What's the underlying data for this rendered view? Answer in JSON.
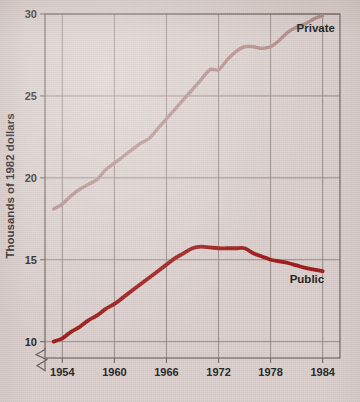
{
  "figure": {
    "background_color": "#d8cdca",
    "plot_area": {
      "left": 45,
      "top": 14,
      "right": 340,
      "bottom": 358
    }
  },
  "chart_data": {
    "type": "line",
    "title": "",
    "subtitle": "",
    "xlabel": "",
    "ylabel": "Thousands of 1982 dollars",
    "xlim": [
      1952,
      1986
    ],
    "ylim": [
      9,
      30
    ],
    "ytick_labels": [
      "10",
      "15",
      "20",
      "25",
      "30"
    ],
    "ytick_values": [
      10,
      15,
      20,
      25,
      30
    ],
    "xtick_labels": [
      "1954",
      "1960",
      "1966",
      "1972",
      "1978",
      "1984"
    ],
    "xtick_values": [
      1954,
      1960,
      1966,
      1972,
      1978,
      1984
    ],
    "grid": true,
    "legend_position": "inline-annotations",
    "y_axis_break": true,
    "y_axis_break_note": "zigzag break below 10 indicating truncated axis",
    "annotations": [
      {
        "text": "Private",
        "x": 1981.0,
        "y": 28.9
      },
      {
        "text": "Public",
        "x": 1980.2,
        "y": 13.6
      }
    ],
    "series": [
      {
        "name": "Private",
        "color": "#b08a87",
        "linewidth": 3.4,
        "x": [
          1953,
          1954,
          1955,
          1956,
          1957,
          1958,
          1959,
          1960,
          1961,
          1962,
          1963,
          1964,
          1965,
          1966,
          1967,
          1968,
          1969,
          1970,
          1971,
          1972,
          1973,
          1974,
          1975,
          1976,
          1977,
          1978,
          1979,
          1980,
          1981,
          1982,
          1983,
          1984
        ],
        "values": [
          18.1,
          18.4,
          18.9,
          19.3,
          19.6,
          19.9,
          20.5,
          20.9,
          21.3,
          21.7,
          22.1,
          22.4,
          23.0,
          23.6,
          24.2,
          24.8,
          25.4,
          26.0,
          26.6,
          26.6,
          27.2,
          27.7,
          28.0,
          28.0,
          27.9,
          28.0,
          28.4,
          28.9,
          29.2,
          29.4,
          29.7,
          29.9
        ]
      },
      {
        "name": "Public",
        "color": "#9b1515",
        "linewidth": 3.8,
        "x": [
          1953,
          1954,
          1955,
          1956,
          1957,
          1958,
          1959,
          1960,
          1961,
          1962,
          1963,
          1964,
          1965,
          1966,
          1967,
          1968,
          1969,
          1970,
          1971,
          1972,
          1973,
          1974,
          1975,
          1976,
          1977,
          1978,
          1979,
          1980,
          1981,
          1982,
          1983,
          1984
        ],
        "values": [
          10.0,
          10.2,
          10.6,
          10.9,
          11.3,
          11.6,
          12.0,
          12.3,
          12.7,
          13.1,
          13.5,
          13.9,
          14.3,
          14.7,
          15.1,
          15.4,
          15.7,
          15.8,
          15.75,
          15.7,
          15.7,
          15.7,
          15.7,
          15.4,
          15.2,
          15.0,
          14.9,
          14.8,
          14.65,
          14.5,
          14.4,
          14.3
        ]
      }
    ]
  }
}
